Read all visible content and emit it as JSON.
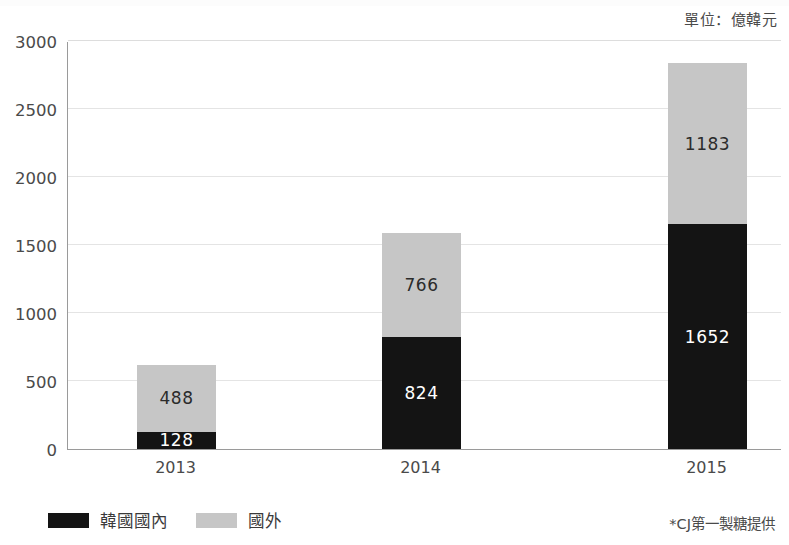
{
  "unit_caption": "單位：億韓元",
  "source_note": "*CJ第一製糖提供",
  "legend": {
    "items": [
      {
        "label": "韓國國內",
        "color": "#141414",
        "key": "domestic"
      },
      {
        "label": "國外",
        "color": "#c6c6c6",
        "key": "overseas"
      }
    ]
  },
  "chart_data": {
    "type": "bar",
    "stacked": true,
    "title": "",
    "subtitle": "",
    "xlabel": "",
    "ylabel": "",
    "unit": "億韓元",
    "categories": [
      "2013",
      "2014",
      "2015"
    ],
    "series": [
      {
        "name": "韓國國內",
        "color": "#141414",
        "label_color": "#ffffff",
        "values": [
          128,
          824,
          1652
        ]
      },
      {
        "name": "國外",
        "color": "#c6c6c6",
        "label_color": "#2b2b2b",
        "values": [
          488,
          766,
          1183
        ]
      }
    ],
    "totals": [
      616,
      1590,
      2835
    ],
    "ylim": [
      0,
      3000
    ],
    "yticks": [
      0,
      500,
      1000,
      1500,
      2000,
      2500,
      3000
    ],
    "ytick_labels": [
      "0",
      "500",
      "1000",
      "1500",
      "2000",
      "2500",
      "3000"
    ],
    "grid": true,
    "grid_axis": "y",
    "legend_position": "bottom-left",
    "annotations": [
      "單位：億韓元",
      "*CJ第一製糖提供"
    ],
    "data_labels": {
      "2013": {
        "韓國國內": "128",
        "國外": "488"
      },
      "2014": {
        "韓國國內": "824",
        "國外": "766"
      },
      "2015": {
        "韓國國內": "1652",
        "國外": "1183"
      }
    }
  }
}
